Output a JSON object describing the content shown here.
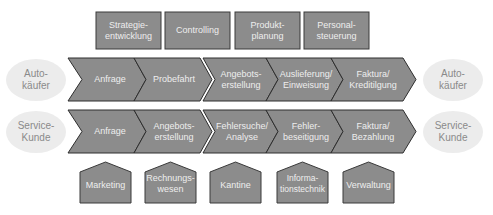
{
  "colors": {
    "box_fill": "#8c8c8c",
    "box_stroke": "#3a3a3a",
    "ellipse_fill": "#ececec",
    "ellipse_text": "#8a8a8a",
    "shape_text": "#eeeeee"
  },
  "support_top": [
    {
      "label": "Strategie-\nentwicklung"
    },
    {
      "label": "Controlling"
    },
    {
      "label": "Produkt-\nplanung"
    },
    {
      "label": "Personal-\nsteuerung"
    }
  ],
  "process_rows": [
    {
      "customer_left": "Auto-\nkäufer",
      "customer_right": "Auto-\nkäufer",
      "steps": [
        {
          "label": "Anfrage"
        },
        {
          "label": "Probefahrt"
        },
        {
          "label": "Angebots-\nerstellung"
        },
        {
          "label": "Auslieferung/\nEinweisung"
        },
        {
          "label": "Faktura/\nKreditilgung"
        }
      ]
    },
    {
      "customer_left": "Service-\nKunde",
      "customer_right": "Service-\nKunde",
      "steps": [
        {
          "label": "Anfrage"
        },
        {
          "label": "Angebots-\nerstellung"
        },
        {
          "label": "Fehlersuche/\nAnalyse"
        },
        {
          "label": "Fehler-\nbeseitigung"
        },
        {
          "label": "Faktura/\nBezahlung"
        }
      ]
    }
  ],
  "support_bottom": [
    {
      "label": "Marketing"
    },
    {
      "label": "Rechnungs-\nwesen"
    },
    {
      "label": "Kantine"
    },
    {
      "label": "Informa-\ntionstechnik"
    },
    {
      "label": "Verwaltung"
    }
  ]
}
